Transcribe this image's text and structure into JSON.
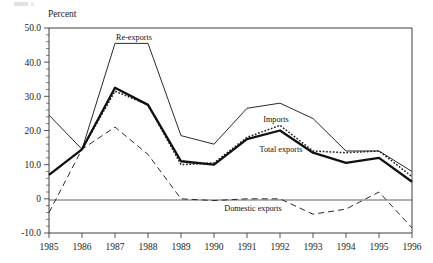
{
  "chart_data": {
    "type": "line",
    "title": "",
    "xlabel": "",
    "ylabel": "Percent",
    "categories": [
      "1985",
      "1986",
      "1987",
      "1988",
      "1989",
      "1990",
      "1991",
      "1992",
      "1993",
      "1994",
      "1995",
      "1996"
    ],
    "x": [
      1985,
      1986,
      1987,
      1988,
      1989,
      1990,
      1991,
      1992,
      1993,
      1994,
      1995,
      1996
    ],
    "ylim": [
      -10.0,
      50.0
    ],
    "xlim": [
      1985,
      1996
    ],
    "grid": false,
    "legend_position": "inline-annotations",
    "y_ticks": [
      "50.0",
      "40.0",
      "30.0",
      "20.0",
      "10.0",
      "0",
      "-10.0"
    ],
    "y_tick_values": [
      50.0,
      40.0,
      30.0,
      20.0,
      10.0,
      0,
      -10.0
    ],
    "series": [
      {
        "name": "Re-exports",
        "style": "solid-thin",
        "values": [
          24.5,
          14.5,
          45.5,
          45.5,
          18.5,
          16.0,
          26.5,
          28.0,
          23.5,
          14.0,
          14.0,
          8.0
        ]
      },
      {
        "name": "Imports",
        "style": "dotted",
        "values": [
          7.0,
          14.5,
          31.5,
          27.5,
          10.0,
          10.5,
          18.0,
          21.5,
          14.0,
          13.5,
          14.0,
          6.5
        ]
      },
      {
        "name": "Total exports",
        "style": "solid-thick",
        "values": [
          7.0,
          14.5,
          32.5,
          27.5,
          11.0,
          10.0,
          17.5,
          20.0,
          13.5,
          10.5,
          12.0,
          5.0
        ]
      },
      {
        "name": "Domestic exports",
        "style": "dashed",
        "values": [
          -4.0,
          14.5,
          21.0,
          13.0,
          0.0,
          -0.5,
          0.0,
          0.0,
          -4.5,
          -3.0,
          2.0,
          -8.5
        ]
      }
    ],
    "annotations": [
      {
        "text": "Re-exports",
        "series": "Re-exports",
        "x_px": 134,
        "y_px": 40
      },
      {
        "text": "Imports",
        "series": "Imports",
        "x_px": 276,
        "y_px": 122
      },
      {
        "text": "Total exports",
        "series": "Total exports",
        "x_px": 281,
        "y_px": 152
      },
      {
        "text": "Domestic exports",
        "series": "Domestic exports",
        "x_px": 253,
        "y_px": 211
      }
    ]
  },
  "colors": {
    "background": "#ffffff",
    "ink": "#1a1a1a",
    "axis": "#2b2b2b"
  }
}
